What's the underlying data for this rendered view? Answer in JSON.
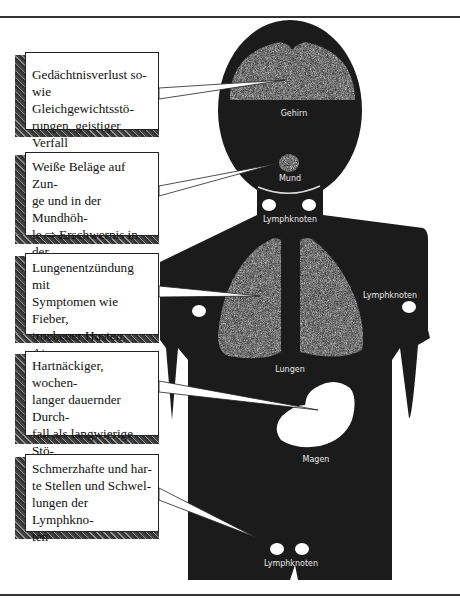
{
  "figure": {
    "callouts": [
      {
        "id": "brain",
        "lines": [
          "Gedächtnisverlust so-",
          "wie Gleichgewichtsstö-",
          "rungen, geistiger Verfall"
        ]
      },
      {
        "id": "mouth",
        "lines": [
          "Weiße Beläge auf Zun-",
          "ge und in der Mundhöh-",
          "le ⇨ Erschwernis in der",
          "Nahrungsaufnahme"
        ]
      },
      {
        "id": "lungs",
        "lines": [
          "Lungenentzündung mit",
          "Symptomen wie Fieber,",
          "trockener Husten, Atem-",
          "not"
        ]
      },
      {
        "id": "stomach",
        "lines": [
          "Hartnäckiger, wochen-",
          "langer dauernder Durch-",
          "fall als langwierige Stö-",
          "rung"
        ]
      },
      {
        "id": "lymph",
        "lines": [
          "Schmerzhafte und har-",
          "te Stellen und Schwel-",
          "lungen der Lymphkno-",
          "ten"
        ]
      }
    ],
    "organ_labels": {
      "brain": "Gehirn",
      "mouth": "Mund",
      "neck_lymph": "Lymphknoten",
      "armpit_lymph": "Lymphknoten",
      "lungs": "Lungen",
      "stomach": "Magen",
      "groin_lymph": "Lymphknoten"
    },
    "colors": {
      "body": "#1a1a1a",
      "organ_texture": "#8a8a8a",
      "lymph_nodes": "#ffffff"
    }
  }
}
